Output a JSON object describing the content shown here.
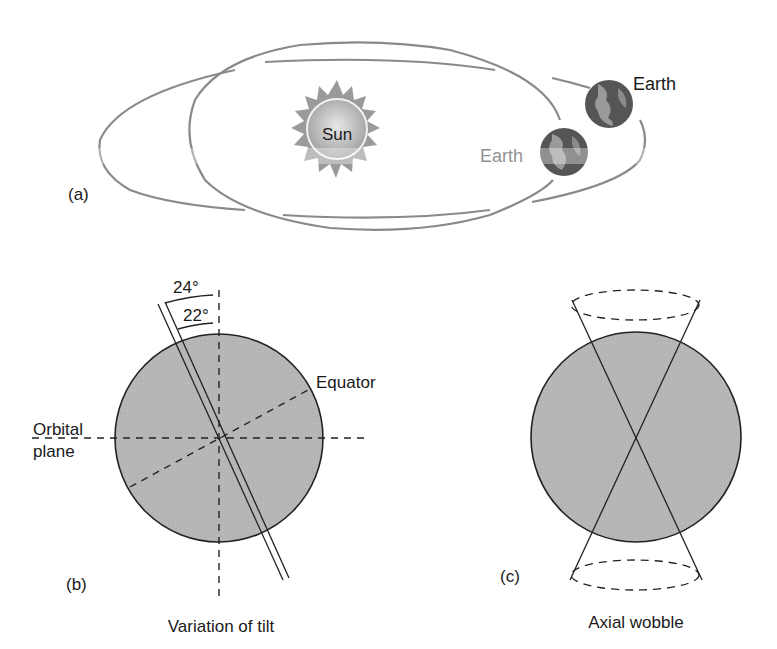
{
  "panel_a": {
    "label": "(a)",
    "sun_label": "Sun",
    "earth_label_1": "Earth",
    "earth_label_2": "Earth",
    "orbit_color": "#8a8a8a",
    "sun_color": "#a8a8a8",
    "earth_dark": "#5a5a5a",
    "earth_light": "#9a9a9a"
  },
  "panel_b": {
    "label": "(b)",
    "angle_max": "24°",
    "angle_min": "22°",
    "equator_label": "Equator",
    "orbital_label_line1": "Orbital",
    "orbital_label_line2": "plane",
    "caption": "Variation of tilt",
    "globe_fill": "#b4b4b4"
  },
  "panel_c": {
    "label": "(c)",
    "caption": "Axial wobble",
    "globe_fill": "#b4b4b4"
  }
}
